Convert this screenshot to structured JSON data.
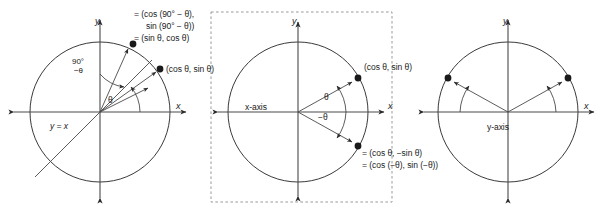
{
  "figure": {
    "background_color": "#ffffff",
    "stroke_color": "#3a3a3a",
    "text_color": "#1a1a1a",
    "panel_count": 3
  },
  "panels": [
    {
      "id": "panel-complementary",
      "name": "complementary-angle-circle",
      "center": {
        "x": 100,
        "y": 112
      },
      "radius": 70,
      "dashed_border": false,
      "axis_labels": {
        "x": "x",
        "y": "y"
      },
      "line_label": "y = x",
      "angle_labels": [
        {
          "text": "θ",
          "name": "theta-arc-label"
        },
        {
          "text": "90°",
          "name": "ninety-degree-label"
        },
        {
          "text": "−θ",
          "name": "minus-theta-label"
        }
      ],
      "point_labels": [
        {
          "name": "complementary-point-label",
          "lines": [
            "= (cos (90° − θ),",
            "sin (90° − θ))",
            "= (sin θ, cos θ)"
          ]
        },
        {
          "name": "theta-point-label",
          "lines": [
            "(cos θ, sin θ)"
          ]
        }
      ],
      "points": [
        {
          "name": "complementary-point",
          "x": 133,
          "y": 44
        },
        {
          "name": "theta-point",
          "x": 160,
          "y": 69
        }
      ]
    },
    {
      "id": "panel-negative-angle",
      "name": "negative-angle-circle",
      "center": {
        "x": 298,
        "y": 112
      },
      "radius": 70,
      "dashed_border": true,
      "dashed_box": {
        "x": 211,
        "y": 12,
        "width": 181,
        "height": 190
      },
      "axis_labels": {
        "x": "x",
        "y": "y"
      },
      "reflection_axis_label": "x-axis",
      "angle_labels": [
        {
          "text": "θ",
          "name": "theta-arc-label"
        },
        {
          "text": "−θ",
          "name": "negative-theta-arc-label"
        }
      ],
      "point_labels": [
        {
          "name": "theta-point-label",
          "lines": [
            "(cos θ, sin θ)"
          ]
        },
        {
          "name": "negative-angle-point-label",
          "lines": [
            "= (cos θ, −sin θ)",
            "= (cos (−θ), sin (−θ))"
          ]
        }
      ],
      "points": [
        {
          "name": "theta-point",
          "x": 358,
          "y": 78
        },
        {
          "name": "negative-theta-point",
          "x": 358,
          "y": 146
        }
      ]
    },
    {
      "id": "panel-supplementary",
      "name": "supplementary-angle-circle",
      "center": {
        "x": 508,
        "y": 112
      },
      "radius": 70,
      "dashed_border": false,
      "axis_labels": {
        "x": "x",
        "y": "y"
      },
      "reflection_axis_label": "y-axis",
      "angle_labels": [],
      "point_labels": [],
      "points": [
        {
          "name": "theta-point",
          "x": 568,
          "y": 78
        },
        {
          "name": "supplementary-point",
          "x": 448,
          "y": 78
        }
      ]
    }
  ]
}
